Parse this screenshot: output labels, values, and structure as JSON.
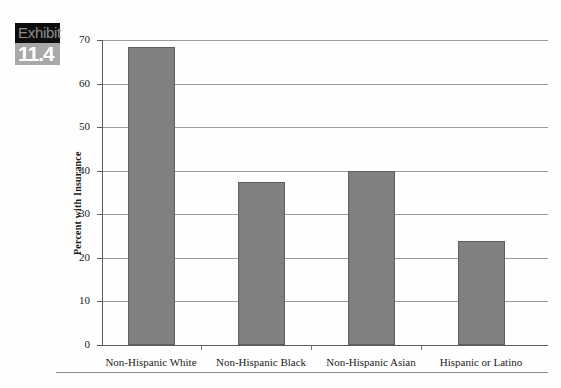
{
  "exhibit": {
    "word": "Exhibit",
    "number": "11.4",
    "word_bg": "#0d0d0d",
    "word_color": "#8e8e8e",
    "num_bg": "#a8a8a8",
    "num_color": "#ffffff"
  },
  "chart_data": {
    "type": "bar",
    "title": "",
    "xlabel": "",
    "ylabel": "Percent with Insurance",
    "categories": [
      "Non-Hispanic White",
      "Non-Hispanic Black",
      "Non-Hispanic Asian",
      "Hispanic or Latino"
    ],
    "values": [
      68.5,
      37.5,
      40.0,
      23.8
    ],
    "ylim": [
      0,
      70
    ],
    "yticks": [
      0,
      10,
      20,
      30,
      40,
      50,
      60,
      70
    ],
    "ytick_labels": [
      "0",
      "10",
      "20",
      "30",
      "40",
      "50",
      "60",
      "70"
    ],
    "grid": true,
    "legend": false,
    "bar_color": "#808080",
    "bar_border_color": "#5f5f5f",
    "gridline_color": "#9b9b9b",
    "axis_color": "#5a5a5a"
  }
}
